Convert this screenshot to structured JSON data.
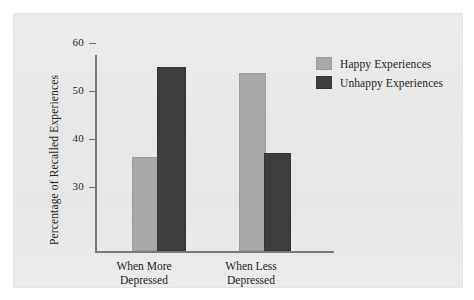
{
  "figure": {
    "background_color": "#ffffff",
    "plate_color": "#e9e9e9"
  },
  "chart_data": {
    "type": "bar",
    "title": "",
    "subtitle": "",
    "xlabel": "",
    "ylabel": "Percentage of Recalled Experiences",
    "categories": [
      "When More\nDepressed",
      "When Less\nDepressed"
    ],
    "category_lines": [
      [
        "When More",
        "Depressed"
      ],
      [
        "When Less",
        "Depressed"
      ]
    ],
    "series": [
      {
        "name": "Happy Experiences",
        "color": "#a9a9a9",
        "values": [
          35.8,
          53.4
        ]
      },
      {
        "name": "Unhappy Experiences",
        "color": "#3d3d3d",
        "values": [
          54.6,
          36.7
        ]
      }
    ],
    "ylim": [
      27.5,
      68
    ],
    "yticks": [
      30,
      40,
      50,
      60
    ],
    "ytick_labels": [
      "30",
      "40",
      "50",
      "60"
    ],
    "grid": false,
    "legend_position": "top-right",
    "legend_entries": [
      {
        "label": "Happy Experiences",
        "swatch": "#a9a9a9"
      },
      {
        "label": "Unhappy Experiences",
        "swatch": "#3d3d3d"
      }
    ],
    "axis_color": "#787878"
  }
}
